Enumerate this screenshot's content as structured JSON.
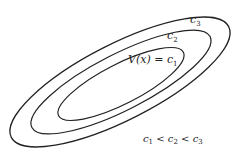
{
  "diagram": {
    "type": "nested-level-sets",
    "stroke_color": "#222222",
    "background": "#ffffff",
    "curves": [
      {
        "id": "c1",
        "label_main": "V(x) = c",
        "label_sub": "1",
        "cx": 121,
        "cy": 84,
        "rx": 70,
        "ry": 20,
        "angle": -27
      },
      {
        "id": "c2",
        "label_main": "c",
        "label_sub": "2",
        "cx": 121,
        "cy": 82,
        "rx": 100,
        "ry": 28,
        "angle": -27
      },
      {
        "id": "c3",
        "label_main": "c",
        "label_sub": "3",
        "cx": 120,
        "cy": 82,
        "rx": 122,
        "ry": 38,
        "angle": -27
      }
    ],
    "relation": {
      "parts": [
        "c",
        "1",
        " < ",
        "c",
        "2",
        " < ",
        "c",
        "3"
      ],
      "text": "c1 < c2 < c3"
    }
  }
}
